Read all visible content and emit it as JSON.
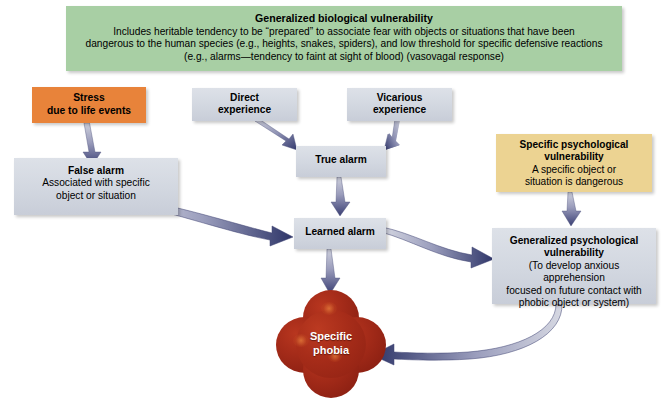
{
  "figure": {
    "colors": {
      "biological_vulnerability_green": "#a8cfa4",
      "stress_orange": "#e8833a",
      "specific_psych_yellow": "#ecd392",
      "alarm_box_grey": "#d2d7e0",
      "phobia_red": "#a42b19",
      "arrow_navy": "#2e3568",
      "arrow_light": "#c9cbd9"
    }
  },
  "nodes": {
    "biological_vulnerability": {
      "title": "Generalized biological vulnerability",
      "line1": "Includes heritable tendency to be “prepared” to associate fear with objects or situations that have been",
      "line2": "dangerous to the human species (e.g., heights, snakes, spiders), and low threshold for specific defensive reactions",
      "line3": "(e.g., alarms—tendency to faint at sight of blood) (vasovagal response)"
    },
    "stress": {
      "line1": "Stress",
      "line2": "due to life events"
    },
    "direct_experience": {
      "line1": "Direct",
      "line2": "experience"
    },
    "vicarious_experience": {
      "line1": "Vicarious",
      "line2": "experience"
    },
    "true_alarm": {
      "title": "True alarm"
    },
    "false_alarm": {
      "title": "False alarm",
      "line1": "Associated with specific",
      "line2": "object or situation"
    },
    "learned_alarm": {
      "title": "Learned alarm"
    },
    "specific_psychological_vulnerability": {
      "title1": "Specific psychological",
      "title2": "vulnerability",
      "line1": "A specific object or",
      "line2": "situation is dangerous"
    },
    "generalized_psychological_vulnerability": {
      "title1": "Generalized psychological",
      "title2": "vulnerability",
      "line1": "(To develop anxious apprehension",
      "line2": "focused on future contact with",
      "line3": "phobic object or system)"
    },
    "specific_phobia": {
      "line1": "Specific",
      "line2": "phobia"
    }
  },
  "arrows": [
    {
      "name": "stress-to-false-alarm",
      "from": "stress",
      "to": "false_alarm",
      "style": "straight-tapered"
    },
    {
      "name": "direct-experience-to-true-alarm",
      "from": "direct_experience",
      "to": "true_alarm",
      "style": "straight-tapered"
    },
    {
      "name": "vicarious-experience-to-true-alarm",
      "from": "vicarious_experience",
      "to": "true_alarm",
      "style": "straight-tapered"
    },
    {
      "name": "true-alarm-to-learned-alarm",
      "from": "true_alarm",
      "to": "learned_alarm",
      "style": "straight-tapered"
    },
    {
      "name": "false-alarm-to-learned-alarm",
      "from": "false_alarm",
      "to": "learned_alarm",
      "style": "curved-tapered"
    },
    {
      "name": "learned-alarm-to-generalized-psychological-vulnerability",
      "from": "learned_alarm",
      "to": "generalized_psychological_vulnerability",
      "style": "curved-tapered"
    },
    {
      "name": "specific-psychological-vulnerability-to-generalized-psychological-vulnerability",
      "from": "specific_psychological_vulnerability",
      "to": "generalized_psychological_vulnerability",
      "style": "straight-tapered"
    },
    {
      "name": "learned-alarm-to-specific-phobia",
      "from": "learned_alarm",
      "to": "specific_phobia",
      "style": "straight-tapered"
    },
    {
      "name": "generalized-psychological-vulnerability-to-specific-phobia",
      "from": "generalized_psychological_vulnerability",
      "to": "specific_phobia",
      "style": "curved-tapered"
    }
  ]
}
